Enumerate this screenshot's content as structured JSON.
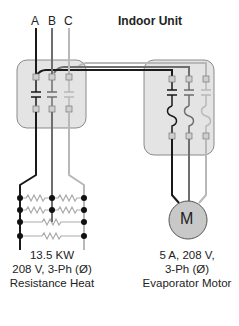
{
  "title": "Indoor Unit",
  "phases": [
    "A",
    "B",
    "C"
  ],
  "colors": {
    "wire_a": "#1a1a1a",
    "wire_b": "#6e6e6e",
    "wire_c": "#b8b8b8",
    "box_fill": "#e4e4e4",
    "box_stroke": "#8a8a8a",
    "motor_fill": "#c8c8c8"
  },
  "motor": {
    "symbol": "M"
  },
  "heater": {
    "line1": "13.5 KW",
    "line2": "208 V, 3-Ph (Ø)",
    "line3": "Resistance Heat"
  },
  "evaporator": {
    "line1": "5 A,  208 V,",
    "line2": "3-Ph (Ø)",
    "line3": "Evaporator Motor"
  }
}
